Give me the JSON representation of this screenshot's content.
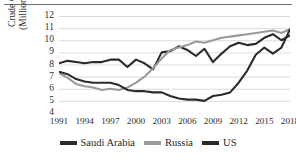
{
  "chart_data": {
    "type": "line",
    "title": "",
    "xlabel": "",
    "ylabel": "Crude Oil Production\n(Million Barrels / Day)",
    "ylim": [
      4,
      12
    ],
    "xlim": [
      1991,
      2018
    ],
    "grid": true,
    "grid_axis": "y",
    "legend_position": "bottom",
    "y_ticks": [
      12,
      11,
      10,
      9,
      8,
      7,
      6,
      5,
      4
    ],
    "x_ticks": [
      1991,
      1994,
      1997,
      2000,
      2003,
      2006,
      2009,
      2012,
      2015,
      2018
    ],
    "x": [
      1991,
      1992,
      1993,
      1994,
      1995,
      1996,
      1997,
      1998,
      1999,
      2000,
      2001,
      2002,
      2003,
      2004,
      2005,
      2006,
      2007,
      2008,
      2009,
      2010,
      2011,
      2012,
      2013,
      2014,
      2015,
      2016,
      2017,
      2018
    ],
    "series": [
      {
        "name": "Saudi Arabia",
        "color": "#2b2b2b",
        "values": [
          8.1,
          8.3,
          8.2,
          8.1,
          8.2,
          8.2,
          8.4,
          8.4,
          7.8,
          8.4,
          8.1,
          7.6,
          9.0,
          9.1,
          9.5,
          9.2,
          8.7,
          9.3,
          8.2,
          8.9,
          9.5,
          9.8,
          9.6,
          9.7,
          10.2,
          10.5,
          10.0,
          10.4
        ]
      },
      {
        "name": "Russia",
        "color": "#9a9a9a",
        "values": [
          7.3,
          6.9,
          6.4,
          6.2,
          6.1,
          5.9,
          6.0,
          5.9,
          6.1,
          6.5,
          7.0,
          7.7,
          8.5,
          9.2,
          9.4,
          9.6,
          9.9,
          9.8,
          10.0,
          10.2,
          10.3,
          10.4,
          10.5,
          10.6,
          10.7,
          10.8,
          10.6,
          10.9
        ]
      },
      {
        "name": "US",
        "color": "#2b2b2b",
        "values": [
          7.4,
          7.2,
          6.8,
          6.6,
          6.5,
          6.5,
          6.5,
          6.3,
          5.9,
          5.8,
          5.8,
          5.7,
          5.7,
          5.4,
          5.2,
          5.1,
          5.1,
          5.0,
          5.4,
          5.5,
          5.7,
          6.5,
          7.5,
          8.8,
          9.4,
          8.9,
          9.4,
          10.9
        ]
      }
    ]
  },
  "legend": {
    "entries": [
      {
        "label": "Saudi Arabia",
        "color": "#2b2b2b"
      },
      {
        "label": "Russia",
        "color": "#9a9a9a"
      },
      {
        "label": "US",
        "color": "#2b2b2b"
      }
    ]
  }
}
